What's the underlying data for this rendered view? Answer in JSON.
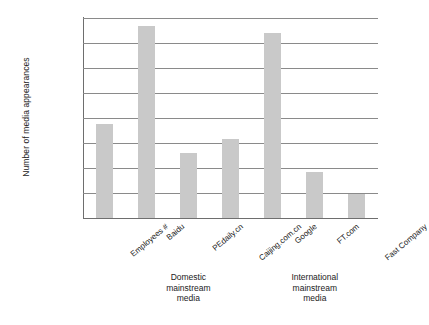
{
  "chart_data": {
    "type": "bar",
    "title": "",
    "xlabel": "",
    "ylabel": "Number of media appearances",
    "yscale": "log",
    "ylim": [
      1,
      100000000
    ],
    "grid": "horizontal",
    "legend": "none",
    "categories": [
      "Employees #",
      "Baidu",
      "PEdaily.cn",
      "Caijing.com.cn",
      "Google",
      "FT.com",
      "Fast Company"
    ],
    "values": [
      6000,
      50000000,
      400,
      1400,
      25000000,
      70,
      9
    ],
    "series": [
      {
        "name": "Number of media appearances",
        "values": [
          6000,
          50000000,
          400,
          1400,
          25000000,
          70,
          9
        ]
      }
    ],
    "ytick_labels": [
      "100,000,000",
      "10,000,000",
      "1,000,000",
      "100,000",
      "10,000",
      "1,000",
      "100",
      "10",
      "1"
    ],
    "ytick_values": [
      100000000,
      10000000,
      1000000,
      100000,
      10000,
      1000,
      100,
      10,
      1
    ],
    "group_annotations": [
      {
        "label": "Domestic\nmainstream\nmedia",
        "lines": [
          "Domestic",
          "mainstream",
          "media"
        ],
        "covers": [
          "Baidu",
          "PEdaily.cn",
          "Caijing.com.cn"
        ]
      },
      {
        "label": "International\nmainstream\nmedia",
        "lines": [
          "International",
          "mainstream",
          "media"
        ],
        "covers": [
          "Google",
          "FT.com",
          "Fast Company"
        ]
      }
    ],
    "colors": {
      "bar": "#c9c9c9",
      "gridline": "#8a8a8a",
      "axis": "#6e6e6e",
      "text": "#222222",
      "background": "#ffffff"
    }
  }
}
